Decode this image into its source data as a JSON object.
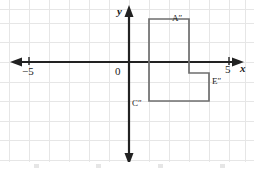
{
  "figure": {
    "kind": "coordinate-plane-diagram",
    "title": "",
    "width": 254,
    "height": 169,
    "background_color": "#ffffff"
  },
  "grid": {
    "visible": true,
    "cell_size_px": 20,
    "line_color": "#e6e6e6",
    "vertical_lines_px": [
      9,
      29,
      49,
      69,
      89,
      109,
      129,
      149,
      169,
      189,
      209,
      229,
      246
    ],
    "horizontal_lines_px": [
      9,
      23,
      42,
      62,
      82,
      101,
      121,
      140,
      160
    ]
  },
  "axes": {
    "color": "#222222",
    "origin_px": {
      "x": 129,
      "y": 62
    },
    "x_axis": {
      "label": "x",
      "arrow_left": true,
      "arrow_right": true,
      "ticks": [
        {
          "label": "−5",
          "value": -5,
          "x_px": 29
        },
        {
          "label": "5",
          "value": 5,
          "x_px": 229
        }
      ]
    },
    "y_axis": {
      "label": "y",
      "arrow_up": true,
      "arrow_down": true,
      "ticks": []
    },
    "origin_label": "0"
  },
  "shape": {
    "name": "L-shaped-polygon",
    "stroke_color": "#6e6e6e",
    "stroke_width": 1.6,
    "fill": "none",
    "closed": true,
    "vertices_px": [
      {
        "x": 149,
        "y": 19
      },
      {
        "x": 189,
        "y": 19
      },
      {
        "x": 189,
        "y": 73
      },
      {
        "x": 209,
        "y": 73
      },
      {
        "x": 209,
        "y": 101
      },
      {
        "x": 149,
        "y": 101
      }
    ],
    "vertices_graph": [
      {
        "x": -1,
        "y": 2.2
      },
      {
        "x": 1,
        "y": 2.2
      },
      {
        "x": 1,
        "y": -0.55
      },
      {
        "x": 2,
        "y": -0.55
      },
      {
        "x": 2,
        "y": -2
      },
      {
        "x": -1,
        "y": -2
      }
    ]
  },
  "point_labels": [
    {
      "id": "A",
      "text": "A″",
      "x_px": 172,
      "y_px": 14
    },
    {
      "id": "E",
      "text": "E″",
      "x_px": 212,
      "y_px": 77
    },
    {
      "id": "C",
      "text": "C″",
      "x_px": 132,
      "y_px": 99
    }
  ]
}
